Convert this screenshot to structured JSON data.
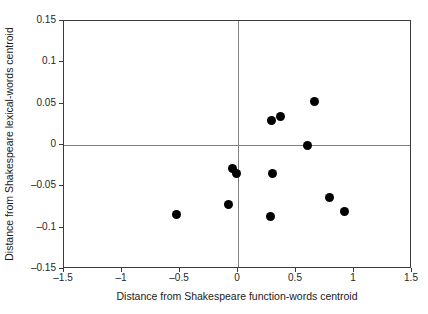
{
  "chart_data": {
    "type": "scatter",
    "title": "",
    "xlabel": "Distance from Shakespeare function-words centroid",
    "ylabel": "Distance from Shakespeare lexical-words centroid",
    "xlim": [
      -1.5,
      1.5
    ],
    "ylim": [
      -0.15,
      0.15
    ],
    "xticks": [
      -1.5,
      -1,
      -0.5,
      0,
      0.5,
      1,
      1.5
    ],
    "xtick_labels": [
      "–1.5",
      "–1",
      "–0.5",
      "0",
      "0.5",
      "1",
      "1.5"
    ],
    "yticks": [
      0.15,
      0.1,
      0.05,
      0,
      -0.05,
      -0.1,
      -0.15
    ],
    "ytick_labels": [
      "0.15",
      "0.1",
      "0.05",
      "0",
      "–0.05",
      "–0.1",
      "–0.15"
    ],
    "grid": false,
    "legend": null,
    "marker": {
      "shape": "circle",
      "color": "#000000",
      "size_px": 9
    },
    "reference_lines": [
      {
        "axis": "y",
        "value": 0,
        "color": "#808080"
      },
      {
        "axis": "x",
        "value": 0,
        "color": "#808080"
      }
    ],
    "points": [
      {
        "x": -0.53,
        "y": -0.084
      },
      {
        "x": -0.08,
        "y": -0.072
      },
      {
        "x": -0.05,
        "y": -0.029
      },
      {
        "x": -0.01,
        "y": -0.034
      },
      {
        "x": 0.28,
        "y": -0.086
      },
      {
        "x": 0.29,
        "y": 0.03
      },
      {
        "x": 0.3,
        "y": -0.034
      },
      {
        "x": 0.37,
        "y": 0.035
      },
      {
        "x": 0.6,
        "y": 0.0
      },
      {
        "x": 0.66,
        "y": 0.053
      },
      {
        "x": 0.79,
        "y": -0.064
      },
      {
        "x": 0.92,
        "y": -0.08
      }
    ]
  },
  "colors": {
    "frame": "#3b3b3b",
    "reference_line": "#808080",
    "marker": "#000000",
    "text": "#1a1a1a",
    "background": "#ffffff"
  }
}
